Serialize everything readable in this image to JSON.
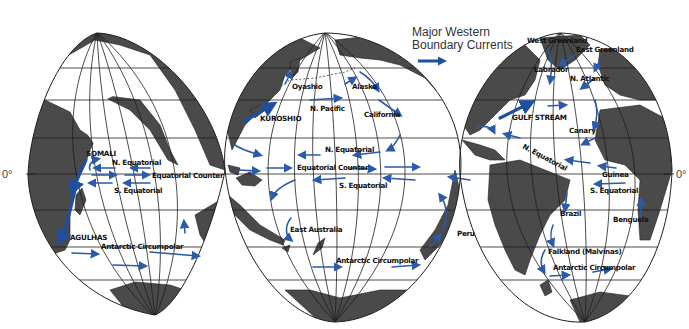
{
  "legend": {
    "line1": "Major Western",
    "line2": "Boundary Currents",
    "arrow_color": "#1f4fa0"
  },
  "equator_labels": {
    "left": "0°",
    "right": "0°"
  },
  "colors": {
    "land": "#4a4a4a",
    "current": "#2a5aa8",
    "grid": "#1e1e1e",
    "ocean": "#ffffff"
  },
  "lobes": [
    {
      "name": "Indian Ocean lobe",
      "region": "left"
    },
    {
      "name": "Pacific Ocean lobe",
      "region": "center"
    },
    {
      "name": "Atlantic Ocean lobe",
      "region": "right"
    }
  ],
  "labels": {
    "indian": {
      "somali": "SOMALI",
      "n_equatorial": "N. Equatorial",
      "equatorial_counter": "Equatorial Counter",
      "s_equatorial": "S. Equatorial",
      "agulhas": "AGULHAS",
      "antarctic_circumpolar": "Antarctic Circumpolar"
    },
    "pacific": {
      "oyashio": "Oyashio",
      "alaska": "Alaska",
      "n_pacific": "N. Pacific",
      "kuroshio": "KUROSHIO",
      "california": "California",
      "n_equatorial": "N. Equatorial",
      "equatorial_counter": "Equatorial Counter",
      "s_equatorial": "S. Equatorial",
      "east_australia": "East Australia",
      "antarctic_circumpolar": "Antarctic Circumpolar",
      "peru": "Peru"
    },
    "atlantic": {
      "west_greenland": "West Greenland",
      "east_greenland": "East Greenland",
      "labrador": "Labrador",
      "n_atlantic": "N. Atlantic",
      "gulf_stream": "GULF STREAM",
      "canary": "Canary",
      "n_equatorial": "N. Equatorial",
      "guinea": "Guinea",
      "s_equatorial": "S. Equatorial",
      "brazil": "Brazil",
      "benguela": "Benguela",
      "falkland": "Falkland (Malvinas)",
      "antarctic_circumpolar": "Antarctic Circumpolar"
    }
  }
}
